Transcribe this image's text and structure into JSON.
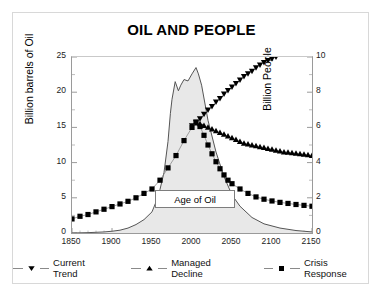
{
  "chart_data": {
    "type": "line",
    "title": "OIL AND PEOPLE",
    "xlabel": "",
    "ylabel": "Billion barrels of Oil",
    "y2label": "Billion People",
    "xlim": [
      1850,
      2150
    ],
    "ylim": [
      0,
      25
    ],
    "y2lim": [
      0,
      10
    ],
    "xticks": [
      "1850",
      "1900",
      "1950",
      "2000",
      "2050",
      "2100",
      "2150"
    ],
    "yticks": [
      "0",
      "5",
      "10",
      "15",
      "20",
      "25"
    ],
    "y2ticks": [
      "0",
      "2",
      "4",
      "6",
      "8",
      "10"
    ],
    "grid": false,
    "legend_position": "bottom",
    "annotations": [
      {
        "text": "Age of Oil",
        "x": 2000,
        "y": 3.2
      }
    ],
    "series": [
      {
        "name": "Oil Production",
        "axis": "left",
        "marker": "none",
        "fill": true,
        "fill_color": "#e8e8e8",
        "line_color": "#555555",
        "in_legend": false,
        "x": [
          1850,
          1870,
          1890,
          1900,
          1910,
          1920,
          1930,
          1940,
          1950,
          1955,
          1960,
          1965,
          1970,
          1973,
          1975,
          1979,
          1983,
          1986,
          1990,
          1995,
          2000,
          2005,
          2008,
          2012,
          2020,
          2030,
          2040,
          2050,
          2060,
          2075,
          2090,
          2110,
          2130,
          2150
        ],
        "y": [
          0.0,
          0.05,
          0.15,
          0.25,
          0.4,
          0.7,
          1.2,
          1.9,
          3.0,
          4.4,
          6.2,
          8.6,
          13.0,
          17.0,
          19.0,
          21.5,
          20.2,
          21.0,
          21.8,
          21.6,
          22.6,
          23.5,
          22.6,
          21.0,
          16.0,
          11.5,
          8.0,
          5.4,
          3.8,
          2.2,
          1.3,
          0.7,
          0.35,
          0.15
        ]
      },
      {
        "name": "Current Trend",
        "axis": "right",
        "marker": "triangle-down",
        "line_color": "#8a8a8a",
        "marker_color": "#000000",
        "in_legend": true,
        "x": [
          2000,
          2005,
          2010,
          2015,
          2020,
          2025,
          2030,
          2035,
          2040,
          2045,
          2050,
          2055,
          2060,
          2065,
          2070,
          2075,
          2080,
          2085,
          2090,
          2095,
          2100,
          2105
        ],
        "y": [
          6.1,
          6.3,
          6.5,
          6.75,
          7.0,
          7.2,
          7.45,
          7.65,
          7.9,
          8.1,
          8.3,
          8.5,
          8.7,
          8.9,
          9.05,
          9.2,
          9.4,
          9.55,
          9.7,
          9.8,
          9.9,
          10.0
        ]
      },
      {
        "name": "Managed Decline",
        "axis": "right",
        "marker": "triangle-up",
        "line_color": "#8a8a8a",
        "marker_color": "#000000",
        "in_legend": true,
        "x": [
          2005,
          2010,
          2015,
          2020,
          2025,
          2030,
          2035,
          2040,
          2045,
          2050,
          2055,
          2060,
          2065,
          2070,
          2075,
          2080,
          2085,
          2090,
          2095,
          2100,
          2105,
          2110,
          2115,
          2120,
          2125,
          2130,
          2135,
          2140,
          2145,
          2150
        ],
        "y": [
          6.25,
          6.2,
          6.1,
          6.0,
          5.9,
          5.8,
          5.7,
          5.6,
          5.5,
          5.4,
          5.3,
          5.2,
          5.1,
          5.05,
          5.0,
          4.95,
          4.9,
          4.85,
          4.8,
          4.75,
          4.7,
          4.65,
          4.6,
          4.58,
          4.55,
          4.52,
          4.5,
          4.47,
          4.44,
          4.4
        ]
      },
      {
        "name": "Crisis Response",
        "axis": "right",
        "marker": "square",
        "line_color": "#8a8a8a",
        "marker_color": "#000000",
        "in_legend": true,
        "x": [
          1850,
          1860,
          1870,
          1880,
          1890,
          1900,
          1910,
          1920,
          1930,
          1940,
          1950,
          1960,
          1970,
          1980,
          1990,
          2000,
          2005,
          2010,
          2015,
          2020,
          2025,
          2030,
          2035,
          2040,
          2045,
          2050,
          2060,
          2070,
          2080,
          2090,
          2100,
          2110,
          2120,
          2130,
          2140,
          2150
        ],
        "y": [
          0.8,
          0.95,
          1.05,
          1.2,
          1.35,
          1.5,
          1.65,
          1.8,
          2.0,
          2.25,
          2.5,
          3.0,
          3.7,
          4.4,
          5.25,
          6.0,
          6.3,
          6.05,
          5.55,
          5.0,
          4.5,
          4.05,
          3.65,
          3.3,
          3.0,
          2.8,
          2.5,
          2.25,
          2.05,
          1.92,
          1.82,
          1.74,
          1.68,
          1.62,
          1.57,
          1.52
        ]
      }
    ]
  },
  "legend": {
    "items": [
      {
        "label": "Current Trend",
        "marker": "triangle-down"
      },
      {
        "label": "Managed Decline",
        "marker": "triangle-up"
      },
      {
        "label": "Crisis Response",
        "marker": "square"
      }
    ]
  },
  "annotation_box": {
    "label": "Age of Oil"
  }
}
